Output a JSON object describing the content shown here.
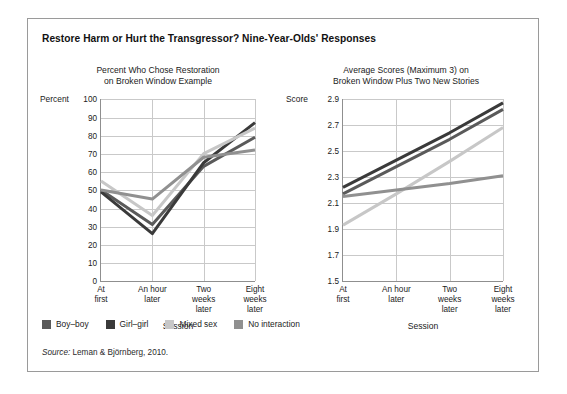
{
  "figure": {
    "title": "Restore Harm or Hurt the Transgressor? Nine-Year-Olds' Responses",
    "source_prefix": "Source:",
    "source_text": " Leman & Björnberg, 2010."
  },
  "legend": {
    "items": [
      {
        "label": "Boy–boy",
        "color": "#5a5a5a"
      },
      {
        "label": "Girl–girl",
        "color": "#3a3a3a"
      },
      {
        "label": "Mixed sex",
        "color": "#c7c7c7"
      },
      {
        "label": "No interaction",
        "color": "#909090"
      }
    ]
  },
  "chart_data": [
    {
      "type": "line",
      "panel": "left",
      "title_line1": "Percent Who Chose Restoration",
      "title_line2": "on Broken Window Example",
      "ylabel": "Percent",
      "xlabel": "Session",
      "categories": [
        "At first",
        "An hour later",
        "Two weeks later",
        "Eight weeks later"
      ],
      "category_lines": [
        [
          "At",
          "first"
        ],
        [
          "An hour",
          "later"
        ],
        [
          "Two",
          "weeks",
          "later"
        ],
        [
          "Eight",
          "weeks",
          "later"
        ]
      ],
      "ylim": [
        0,
        100
      ],
      "yticks": [
        0,
        10,
        20,
        30,
        40,
        50,
        60,
        70,
        80,
        90,
        100
      ],
      "ytick_labels": [
        "0",
        "10",
        "20",
        "30",
        "40",
        "50",
        "60",
        "70",
        "80",
        "90",
        "100"
      ],
      "grid": true,
      "legend_position": "below-figure",
      "series": [
        {
          "name": "Boy–boy",
          "color": "#5a5a5a",
          "values": [
            50,
            31,
            63,
            79
          ]
        },
        {
          "name": "Girl–girl",
          "color": "#3a3a3a",
          "values": [
            49,
            26,
            65,
            87
          ]
        },
        {
          "name": "Mixed sex",
          "color": "#c7c7c7",
          "values": [
            55,
            36,
            70,
            84
          ]
        },
        {
          "name": "No interaction",
          "color": "#909090",
          "values": [
            50,
            45,
            68,
            72
          ]
        }
      ]
    },
    {
      "type": "line",
      "panel": "right",
      "title_line1": "Average Scores (Maximum 3) on",
      "title_line2": "Broken Window Plus Two New Stories",
      "ylabel": "Score",
      "xlabel": "Session",
      "categories": [
        "At first",
        "An hour later",
        "Two weeks later",
        "Eight weeks later"
      ],
      "category_lines": [
        [
          "At",
          "first"
        ],
        [
          "An hour",
          "later"
        ],
        [
          "Two",
          "weeks",
          "later"
        ],
        [
          "Eight",
          "weeks",
          "later"
        ]
      ],
      "ylim": [
        1.5,
        2.9
      ],
      "yticks": [
        1.5,
        1.7,
        1.9,
        2.1,
        2.3,
        2.5,
        2.7,
        2.9
      ],
      "ytick_labels": [
        "1.5",
        "1.7",
        "1.9",
        "2.1",
        "2.3",
        "2.5",
        "2.7",
        "2.9"
      ],
      "grid": true,
      "legend_position": "below-figure",
      "series": [
        {
          "name": "Boy–boy",
          "color": "#5a5a5a",
          "values": [
            2.17,
            2.38,
            2.59,
            2.82
          ]
        },
        {
          "name": "Girl–girl",
          "color": "#3a3a3a",
          "values": [
            2.22,
            2.43,
            2.64,
            2.87
          ]
        },
        {
          "name": "Mixed sex",
          "color": "#c7c7c7",
          "values": [
            1.93,
            2.17,
            2.42,
            2.68
          ]
        },
        {
          "name": "No interaction",
          "color": "#909090",
          "values": [
            2.15,
            2.2,
            2.25,
            2.31
          ]
        }
      ]
    }
  ]
}
